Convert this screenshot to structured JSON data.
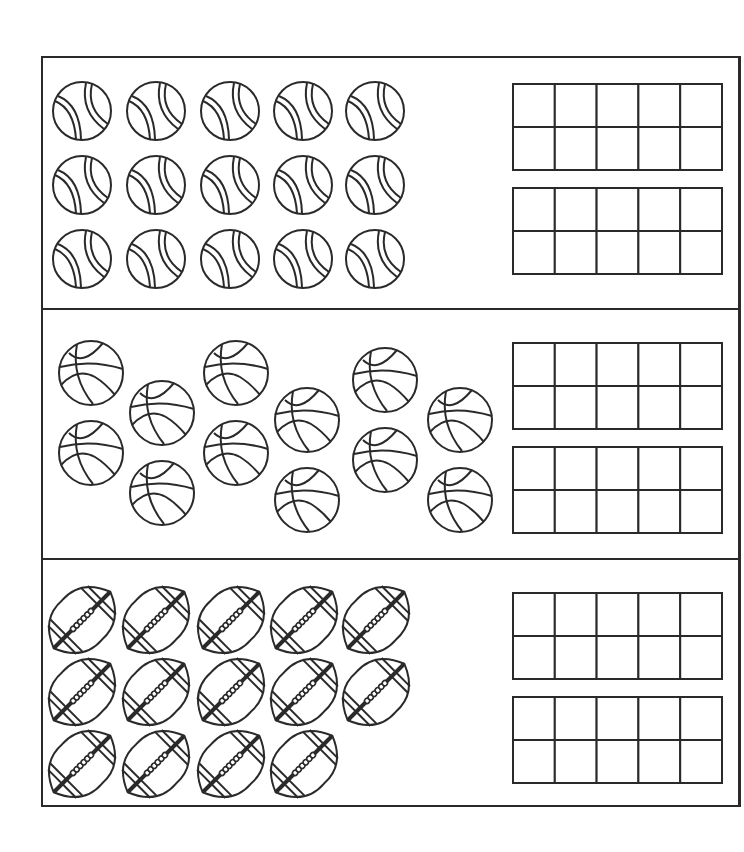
{
  "worksheet": {
    "title": "Count the sports balls and fill the ten frames",
    "sections": [
      {
        "name": "tennis-balls",
        "object": "tennis ball",
        "count": 15,
        "layout": "grid 3 rows x 5",
        "ten_frames": 2
      },
      {
        "name": "basketballs",
        "object": "basketball",
        "count": 12,
        "layout": "scattered 6 columns x 2",
        "ten_frames": 2
      },
      {
        "name": "footballs",
        "object": "football",
        "count": 14,
        "layout": "grid rows 5,5,4",
        "ten_frames": 2
      }
    ],
    "ten_frame": {
      "rows": 2,
      "columns": 5
    }
  },
  "colors": {
    "ink": "#2a2a2a",
    "paper": "#ffffff"
  }
}
